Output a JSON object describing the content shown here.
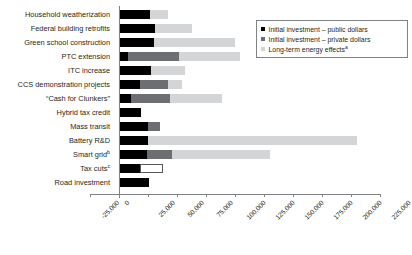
{
  "chart_data": {
    "type": "bar",
    "orientation": "horizontal",
    "stacked": true,
    "title": "",
    "xlabel": "",
    "ylabel": "",
    "xlim": [
      -25000,
      225000
    ],
    "xticks": [
      "-25,000",
      "0",
      "25,000",
      "50,000",
      "75,000",
      "100,000",
      "125,000",
      "150,000",
      "175,000",
      "200,000",
      "225,000"
    ],
    "xtick_values": [
      -25000,
      0,
      25000,
      50000,
      75000,
      100000,
      125000,
      150000,
      175000,
      200000,
      225000
    ],
    "grid": false,
    "legend_position": "upper right",
    "categories": [
      "Household weatherization",
      "Federal building retrofits",
      "Green school construction",
      "PTC extension",
      "ITC increase",
      "CCS demonstration projects",
      "“Cash for Clunkers”",
      "Hybrid tax credit",
      "Mass transit",
      "Battery R&D",
      "Smart grid",
      "Tax cuts",
      "Road investment"
    ],
    "category_superscripts": [
      "",
      "",
      "",
      "",
      "",
      "",
      "",
      "",
      "",
      "",
      "b",
      "c",
      ""
    ],
    "series": [
      {
        "name": "Initial investment – public dollars",
        "color": "#000000",
        "style": "solid",
        "values": [
          27000,
          31000,
          30000,
          8000,
          28000,
          18000,
          10000,
          19000,
          25000,
          25000,
          24000,
          18000,
          26000
        ]
      },
      {
        "name": "Initial investment – private dollars",
        "color": "#6d6e71",
        "style": "solid",
        "values": [
          0,
          0,
          0,
          44000,
          0,
          24000,
          34000,
          0,
          10000,
          0,
          22000,
          0,
          0
        ]
      },
      {
        "name": "Long-term energy effects",
        "color": "#d4d5d7",
        "style": "solid",
        "values": [
          15000,
          32000,
          70000,
          52000,
          29000,
          12000,
          45000,
          0,
          0,
          180000,
          84000,
          0,
          0
        ]
      },
      {
        "name": "Tax cuts outline segment",
        "color": "#ffffff",
        "style": "outline",
        "values": [
          0,
          0,
          0,
          0,
          0,
          0,
          0,
          0,
          0,
          0,
          0,
          20000,
          0
        ]
      }
    ]
  },
  "legend": {
    "items": [
      {
        "label": "Initial investment – public dollars",
        "superscript": "",
        "swatch": "public"
      },
      {
        "label": "Initial investment – private dollars",
        "superscript": "",
        "swatch": "private"
      },
      {
        "label": "Long-term energy effects",
        "superscript": "a",
        "swatch": "longterm"
      }
    ]
  },
  "colors": {
    "public": "#000000",
    "private": "#6d6e71",
    "longterm": "#d4d5d7",
    "axis": "#808285",
    "text": "#231f20"
  }
}
